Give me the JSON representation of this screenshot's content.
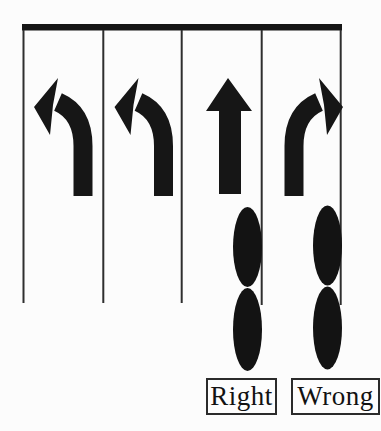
{
  "diagram": {
    "type": "traffic-lane-position-diagram",
    "ink_color": "#161616",
    "background_color": "#fcfcfc",
    "stop_line": "horizontal-bar-top",
    "lanes": [
      {
        "index": 1,
        "marking": "left-turn-arrow",
        "rider": null
      },
      {
        "index": 2,
        "marking": "left-turn-arrow",
        "rider": null
      },
      {
        "index": 3,
        "marking": "straight-arrow",
        "rider": "two-wheeler-beside-lane-line",
        "verdict": "Right"
      },
      {
        "index": 4,
        "marking": "right-turn-arrow",
        "rider": "two-wheeler-beside-road-edge",
        "verdict": "Wrong"
      }
    ]
  },
  "labels": {
    "right": "Right",
    "wrong": "Wrong"
  }
}
